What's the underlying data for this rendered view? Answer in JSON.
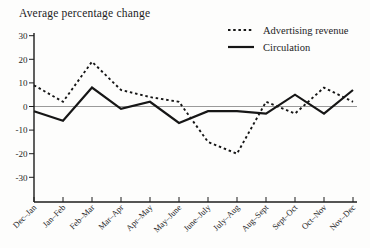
{
  "chart": {
    "title": "Average percentage change",
    "legend": [
      {
        "label": "Advertising revenue",
        "style": "dashed"
      },
      {
        "label": "Circulation",
        "style": "solid"
      }
    ]
  },
  "chart_data": {
    "type": "line",
    "title": "Average percentage change",
    "categories": [
      "Dec–Jan",
      "Jan–Feb",
      "Feb–Mar",
      "Mar–Apr",
      "Apr–May",
      "May–June",
      "June–July",
      "July–Aug",
      "Aug–Sept",
      "Sept–Oct",
      "Oct–Nov",
      "Nov–Dec"
    ],
    "series": [
      {
        "name": "Advertising revenue",
        "line_style": "dashed",
        "values": [
          9,
          2,
          19,
          7,
          4,
          2,
          -15,
          -20,
          2,
          -3,
          8,
          2
        ]
      },
      {
        "name": "Circulation",
        "line_style": "solid",
        "values": [
          -2,
          -6,
          8,
          -1,
          2,
          -7,
          -2,
          -2,
          -3,
          5,
          -3,
          7
        ]
      }
    ],
    "ylabel": "Average percentage change",
    "xlabel": "",
    "ylim": [
      -30,
      30
    ],
    "yticks": [
      30,
      20,
      10,
      0,
      -10,
      -20,
      -30
    ],
    "ytick_labels": [
      "30",
      "20",
      "10",
      "0",
      "-10",
      "-20",
      "-30"
    ],
    "zero_line": true,
    "grid": false,
    "legend_position": "top-right",
    "colors": {
      "line": "#161616",
      "zero_line": "#8f8f8f",
      "axis": "#1c1c1c",
      "text": "#1c1c1c",
      "background": "#fdfdfc"
    }
  }
}
